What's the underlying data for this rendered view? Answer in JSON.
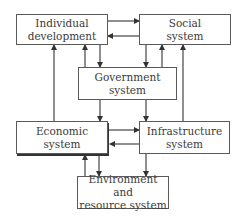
{
  "diagram": {
    "nodes": {
      "individual": {
        "label": "Individual\ndevelopment"
      },
      "social": {
        "label": "Social\nsystem"
      },
      "government": {
        "label": "Government\nsystem"
      },
      "economic": {
        "label": "Economic\nsystem"
      },
      "infrastructure": {
        "label": "Infrastructure\nsystem"
      },
      "environment": {
        "label": "Environment and\nresource system"
      }
    },
    "edges": [
      {
        "from": "individual",
        "to": "social"
      },
      {
        "from": "social",
        "to": "individual"
      },
      {
        "from": "individual",
        "to": "government"
      },
      {
        "from": "government",
        "to": "individual"
      },
      {
        "from": "social",
        "to": "government"
      },
      {
        "from": "government",
        "to": "social"
      },
      {
        "from": "economic",
        "to": "individual"
      },
      {
        "from": "infrastructure",
        "to": "social"
      },
      {
        "from": "government",
        "to": "economic"
      },
      {
        "from": "government",
        "to": "infrastructure"
      },
      {
        "from": "economic",
        "to": "infrastructure"
      },
      {
        "from": "infrastructure",
        "to": "economic"
      },
      {
        "from": "environment",
        "to": "economic"
      },
      {
        "from": "economic",
        "to": "environment"
      },
      {
        "from": "infrastructure",
        "to": "environment"
      }
    ],
    "colors": {
      "line": "#333333",
      "border": "#5a5a5a",
      "text": "#3a3a3a"
    }
  }
}
